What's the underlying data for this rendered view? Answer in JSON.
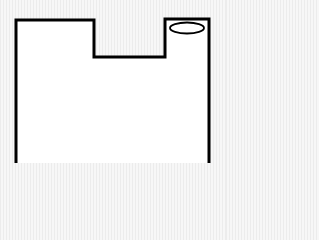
{
  "diagram": {
    "type": "floor-plan-outline",
    "canvas": {
      "width": 226,
      "height": 188
    },
    "colors": {
      "background": "#f1f1f1",
      "interior": "#ffffff",
      "wall": "#000000",
      "fixture": "#000000"
    },
    "wall_width": 3,
    "outline_points": [
      [
        16,
        163
      ],
      [
        16,
        20
      ],
      [
        94,
        20
      ],
      [
        94,
        57
      ],
      [
        165,
        57
      ],
      [
        165,
        19
      ],
      [
        209,
        19
      ],
      [
        209,
        163
      ]
    ],
    "fixture": {
      "shape": "ellipse",
      "label": "",
      "cx": 187,
      "cy": 28,
      "rx": 17,
      "ry": 5.5
    },
    "open_side": "bottom"
  }
}
